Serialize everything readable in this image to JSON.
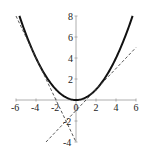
{
  "chart_data": {
    "type": "line",
    "title": "",
    "xlabel": "",
    "ylabel": "",
    "xlim": [
      -6,
      6
    ],
    "ylim": [
      -4,
      8
    ],
    "grid": false,
    "legend": null,
    "x_ticks": [
      -6,
      -4,
      -2,
      0,
      2,
      4,
      6
    ],
    "y_ticks": [
      -4,
      -2,
      2,
      4,
      6,
      8
    ],
    "x_tick_labels": [
      "-6",
      "-4",
      "-2",
      "0",
      "2",
      "4",
      "6"
    ],
    "y_tick_labels": [
      "-4",
      "-2",
      "2",
      "4",
      "6",
      "8"
    ],
    "series": [
      {
        "name": "parabola",
        "style": "solid",
        "formula": "y = x^2/4",
        "x": [
          -5.66,
          -5,
          -4,
          -3,
          -2,
          -1,
          0,
          1,
          2,
          3,
          4,
          5,
          5.66
        ],
        "y": [
          8,
          6.25,
          4,
          2.25,
          1,
          0.25,
          0,
          0.25,
          1,
          2.25,
          4,
          6.25,
          8
        ]
      },
      {
        "name": "tangent-at-x-minus-4",
        "style": "dashed",
        "formula": "y = -2x - 4",
        "x": [
          -6,
          0
        ],
        "y": [
          8,
          -4
        ]
      },
      {
        "name": "tangent-at-x-2",
        "style": "dashed",
        "formula": "y = x - 1",
        "x": [
          -3,
          6
        ],
        "y": [
          -4,
          5
        ]
      }
    ]
  },
  "colors": {
    "curve": "#111111",
    "tangent": "#444444",
    "axis": "#999999",
    "background": "#ffffff"
  }
}
